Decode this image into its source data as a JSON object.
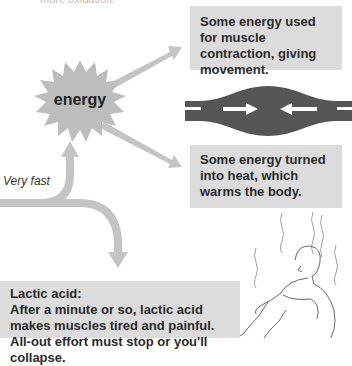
{
  "header": {
    "cut_text": "more oxidation."
  },
  "burst": {
    "label": "energy",
    "color": "#bdbdbd"
  },
  "paths": {
    "label": "Very fast",
    "arrow_color": "#c4c4c4"
  },
  "boxes": {
    "movement": {
      "text": "Some energy used for muscle contraction, giving movement."
    },
    "heat": {
      "text": "Some energy turned into heat, which warms the body."
    },
    "lactic": {
      "title": "Lactic acid:",
      "text": "After a minute or so, lactic acid makes muscles tired and painful. All-out effort must stop or you'll collapse."
    }
  },
  "muscle": {
    "color": "#555555",
    "arrow_color": "#ffffff"
  },
  "illustration": {
    "subject": "exhausted person sitting hugging knees with heat lines"
  },
  "colors": {
    "box_bg": "#dcdcdc",
    "text": "#2a2a2a"
  }
}
